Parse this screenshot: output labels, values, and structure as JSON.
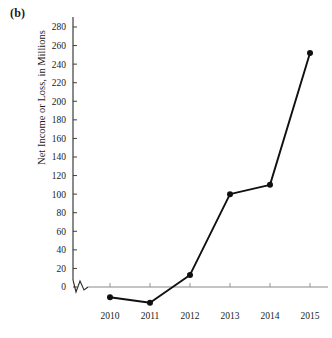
{
  "figure": {
    "panel_label": "(b)"
  },
  "chart_data": {
    "type": "line",
    "title": "",
    "subtitle": "",
    "xlabel": "",
    "ylabel": "Net Income or Loss, in Millions",
    "categories": [
      "2010",
      "2011",
      "2012",
      "2013",
      "2014",
      "2015"
    ],
    "x": [
      2010,
      2011,
      2012,
      2013,
      2014,
      2015
    ],
    "values": [
      -11,
      -17,
      13,
      100,
      110,
      252
    ],
    "series": [
      {
        "name": "Net Income or Loss",
        "values": [
          -11,
          -17,
          13,
          100,
          110,
          252
        ]
      }
    ],
    "ylim": [
      -20,
      290
    ],
    "xlim": [
      2009.5,
      2015.5
    ],
    "yticks": [
      0,
      20,
      40,
      60,
      80,
      100,
      120,
      140,
      160,
      180,
      200,
      220,
      240,
      260,
      280
    ],
    "ytick_labels": [
      "0",
      "20",
      "40",
      "60",
      "80",
      "100",
      "120",
      "140",
      "160",
      "180",
      "200",
      "220",
      "240",
      "260",
      "280"
    ],
    "xtick_labels": [
      "2010",
      "2011",
      "2012",
      "2013",
      "2014",
      "2015"
    ],
    "grid": false,
    "legend": null,
    "legend_position": "none",
    "annotations": [
      "axis-break-zigzag-below-zero"
    ],
    "marker": "filled-circle",
    "line_color": "#101010",
    "axis_color": "#2b2b2b",
    "x_axis_color": "#8a8a8a"
  }
}
